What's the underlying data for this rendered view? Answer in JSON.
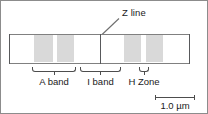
{
  "figure": {
    "type": "sarcomere-banding-diagram",
    "background_color": "#ffffff",
    "border_color": "#8c8c8c",
    "width": 208,
    "height": 114
  },
  "callout": {
    "label": "Z line",
    "leader_line_color": "#6e6e6e",
    "points_to": "z-line-center"
  },
  "myofibril": {
    "outline_color": "#808080",
    "fill_color": "#ffffff",
    "left": 8,
    "right": 189,
    "top": 33,
    "bottom": 63
  },
  "z_lines": [
    {
      "name": "z-line-left",
      "x": 8,
      "color": "#58595b"
    },
    {
      "name": "z-line-center",
      "x": 99,
      "color": "#58595b"
    },
    {
      "name": "z-line-right",
      "x": 188,
      "color": "#58595b"
    }
  ],
  "bands": [
    {
      "name": "band-1",
      "x": 33,
      "width": 19,
      "color": "#d9d9d9"
    },
    {
      "name": "band-2",
      "x": 56,
      "width": 17,
      "color": "#d9d9d9"
    },
    {
      "name": "band-3",
      "x": 123,
      "width": 17,
      "color": "#d9d9d9"
    },
    {
      "name": "band-4",
      "x": 145,
      "width": 17,
      "color": "#d9d9d9"
    }
  ],
  "annotations": [
    {
      "name": "a-band",
      "label": "A band",
      "x": 31,
      "width": 44,
      "label_center": 53
    },
    {
      "name": "i-band",
      "label": "I band",
      "x": 79,
      "width": 41,
      "label_center": 99.5
    },
    {
      "name": "h-zone",
      "label": "H Zone",
      "x": 138,
      "width": 10,
      "label_center": 143
    }
  ],
  "scale_bar": {
    "label": "1.0 µm",
    "x": 154,
    "width": 40,
    "line_color": "#4d4d4d"
  }
}
